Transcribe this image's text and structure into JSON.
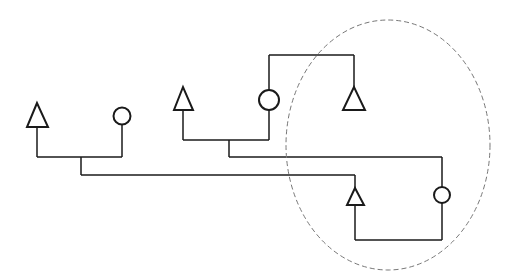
{
  "diagram": {
    "type": "pedigree-tree",
    "colors": {
      "line": "#1a1a1a",
      "ellipse": "#777777",
      "background": "#ffffff"
    },
    "nodes": [
      {
        "id": "tri-left",
        "shape": "triangle",
        "x": 37,
        "y": 115
      },
      {
        "id": "circ-left",
        "shape": "circle",
        "x": 122,
        "y": 116
      },
      {
        "id": "tri-mid",
        "shape": "triangle",
        "x": 183,
        "y": 99
      },
      {
        "id": "circ-mid",
        "shape": "circle",
        "x": 269,
        "y": 100
      },
      {
        "id": "tri-top-right",
        "shape": "triangle",
        "x": 354,
        "y": 99
      },
      {
        "id": "tri-bottom",
        "shape": "triangle",
        "x": 355,
        "y": 196
      },
      {
        "id": "circ-bottom-right",
        "shape": "circle",
        "x": 442,
        "y": 195
      }
    ],
    "group": {
      "shape": "dashed-ellipse",
      "cx": 388,
      "cy": 145,
      "rx": 102,
      "ry": 125
    }
  }
}
